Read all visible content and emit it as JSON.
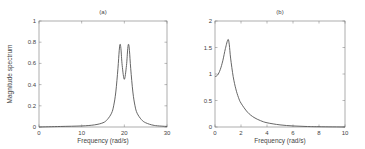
{
  "chart_data": [
    {
      "type": "line",
      "title": "(a)",
      "xlabel": "Frequency (rad/s)",
      "ylabel": "Magnitude spectrum",
      "xlim": [
        0,
        30
      ],
      "ylim": [
        0,
        1
      ],
      "xticks": [
        "0",
        "10",
        "20",
        "30"
      ],
      "yticks": [
        "0",
        "0.2",
        "0.4",
        "0.6",
        "0.8",
        "1"
      ],
      "grid": false,
      "note": "Values estimated visually from the thumbnail; not from a known underlying model.",
      "series": [
        {
          "name": "magnitude",
          "x": [
            0,
            5,
            10,
            13,
            15,
            16,
            17,
            17.5,
            18,
            18.5,
            18.8,
            19,
            19.2,
            19.5,
            20,
            20.5,
            20.8,
            21,
            21.2,
            21.5,
            22,
            22.5,
            23,
            24,
            25,
            27,
            30
          ],
          "y": [
            0.0,
            0.005,
            0.01,
            0.02,
            0.04,
            0.07,
            0.13,
            0.2,
            0.33,
            0.55,
            0.72,
            0.78,
            0.74,
            0.58,
            0.45,
            0.58,
            0.74,
            0.78,
            0.72,
            0.55,
            0.33,
            0.2,
            0.13,
            0.07,
            0.04,
            0.015,
            0.005
          ]
        }
      ]
    },
    {
      "type": "line",
      "title": "(b)",
      "xlabel": "Frequency (rad/s)",
      "ylabel": "",
      "xlim": [
        0,
        10
      ],
      "ylim": [
        0,
        2
      ],
      "xticks": [
        "0",
        "2",
        "4",
        "6",
        "8",
        "10"
      ],
      "yticks": [
        "0",
        "0.5",
        "1",
        "1.5",
        "2"
      ],
      "grid": false,
      "note": "Values estimated visually from the thumbnail; not from a known underlying model.",
      "series": [
        {
          "name": "magnitude",
          "x": [
            0,
            0.2,
            0.4,
            0.6,
            0.8,
            1.0,
            1.1,
            1.2,
            1.4,
            1.6,
            1.8,
            2.0,
            2.5,
            3.0,
            3.5,
            4.0,
            5.0,
            6.0,
            7.0,
            8.0,
            10.0
          ],
          "y": [
            0.95,
            0.98,
            1.08,
            1.25,
            1.48,
            1.65,
            1.55,
            1.3,
            0.95,
            0.72,
            0.56,
            0.45,
            0.28,
            0.18,
            0.12,
            0.08,
            0.04,
            0.02,
            0.01,
            0.005,
            0.0
          ]
        }
      ]
    }
  ],
  "panels": {
    "a": {
      "title": "(a)",
      "xlabel": "Frequency (rad/s)",
      "ylabel": "Magnitude spectrum"
    },
    "b": {
      "title": "(b)",
      "xlabel": "Frequency (rad/s)"
    }
  },
  "colors": {
    "axis": "#555555",
    "curve": "#555555",
    "text": "#444444",
    "background": "#ffffff"
  }
}
